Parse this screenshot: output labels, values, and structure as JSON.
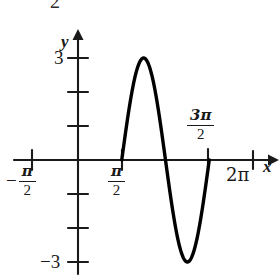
{
  "figure": {
    "title": "",
    "stray_top_text": "2",
    "axis_labels": {
      "x": "x",
      "y": "y"
    },
    "tick_labels": {
      "y_positive": "3",
      "y_negative": "−3",
      "x_neg_half_pi_minus": "−",
      "x_neg_half_pi_num": "π",
      "x_neg_half_pi_den": "2",
      "x_half_pi_num": "π",
      "x_half_pi_den": "2",
      "x_three_half_pi_num": "3π",
      "x_three_half_pi_den": "2",
      "x_two_pi": "2π"
    },
    "colors": {
      "ink": "#1a1a1a",
      "curve": "#000000",
      "background": "#ffffff"
    }
  },
  "chart_data": {
    "type": "line",
    "title": "",
    "xlabel": "x",
    "ylabel": "y",
    "xlim": [
      -1.5707963,
      6.2831853
    ],
    "ylim": [
      -3.4,
      3.4
    ],
    "grid": false,
    "legend": null,
    "function": "y = 3 sin(2(x − π/2))",
    "amplitude": 3,
    "period": 3.1415927,
    "domain_drawn": [
      1.5707963,
      4.712389
    ],
    "x_tick_values": [
      -1.5707963,
      1.5707963,
      3.1415927,
      4.712389,
      6.2831853
    ],
    "x_tick_labels": [
      "−π/2",
      "π/2",
      "",
      "3π/2",
      "2π"
    ],
    "y_tick_values": [
      3,
      2,
      1,
      -1,
      -2,
      -3
    ],
    "y_tick_labels": [
      "3",
      "",
      "",
      "",
      "",
      "−3"
    ],
    "key_points": [
      {
        "label": "start zero",
        "x": 1.5707963,
        "y": 0
      },
      {
        "label": "maximum",
        "x": 2.3561945,
        "y": 3
      },
      {
        "label": "mid zero",
        "x": 3.1415927,
        "y": 0
      },
      {
        "label": "minimum",
        "x": 3.9269908,
        "y": -3
      },
      {
        "label": "end zero",
        "x": 4.712389,
        "y": 0
      }
    ],
    "series": [
      {
        "name": "y = 3 sin(2(x - π/2))",
        "x": [
          1.5707963,
          1.7671459,
          1.9634954,
          2.1598449,
          2.3561945,
          2.552544,
          2.7488936,
          2.9452431,
          3.1415927,
          3.3379422,
          3.5342917,
          3.7306413,
          3.9269908,
          4.1233404,
          4.3196899,
          4.5160395,
          4.712389
        ],
        "y": [
          0,
          1.1480503,
          2.1213203,
          2.7716386,
          3,
          2.7716386,
          2.1213203,
          1.1480503,
          0,
          -1.1480503,
          -2.1213203,
          -2.7716386,
          -3,
          -2.7716386,
          -2.1213203,
          -1.1480503,
          0
        ]
      }
    ]
  }
}
